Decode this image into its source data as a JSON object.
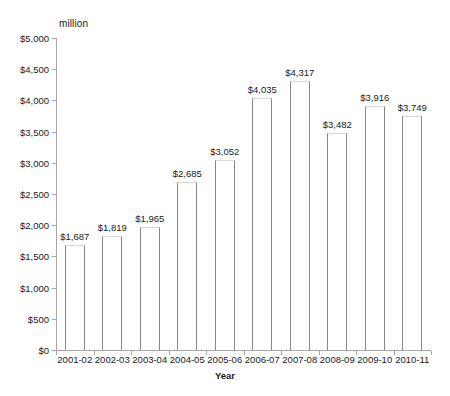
{
  "chart_data": {
    "type": "bar",
    "title": "",
    "subtitle": "",
    "unit_label": "million",
    "xlabel": "Year",
    "ylabel": "",
    "ylim": [
      0,
      5000
    ],
    "ytick_step": 500,
    "grid": false,
    "legend": null,
    "categories": [
      "2001-02",
      "2002-03",
      "2003-04",
      "2004-05",
      "2005-06",
      "2006-07",
      "2007-08",
      "2008-09",
      "2009-10",
      "2010-11"
    ],
    "values": [
      1687,
      1819,
      1965,
      2685,
      3052,
      4035,
      4317,
      3482,
      3916,
      3749
    ],
    "data_labels": [
      "$1,687",
      "$1,819",
      "$1,965",
      "$2,685",
      "$3,052",
      "$4,035",
      "$4,317",
      "$3,482",
      "$3,916",
      "$3,749"
    ],
    "ytick_labels": [
      "$0",
      "$500",
      "$1,000",
      "$1,500",
      "$2,000",
      "$2,500",
      "$3,000",
      "$3,500",
      "$4,000",
      "$4,500",
      "$5,000"
    ],
    "ytick_values": [
      0,
      500,
      1000,
      1500,
      2000,
      2500,
      3000,
      3500,
      4000,
      4500,
      5000
    ],
    "colors": {
      "background": "#ffffff",
      "bar_fill": "#ffffff",
      "bar_border": "#868686",
      "axis_line": "#a6a6a6",
      "text": "#1a1a1a"
    }
  }
}
